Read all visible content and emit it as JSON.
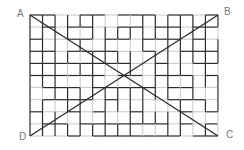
{
  "diagram": {
    "type": "grid-with-diagonals",
    "grid": {
      "columns": 15,
      "rows": 10,
      "origin_x": 30,
      "origin_y": 15,
      "cell_width": 12.53,
      "cell_height": 12.1,
      "dark_color": "#2b2b2b",
      "light_color": "#c8c8c8"
    },
    "corners": [
      {
        "id": "A",
        "label": "A",
        "x": 17,
        "y": 9
      },
      {
        "id": "B",
        "label": "B",
        "x": 224,
        "y": 7
      },
      {
        "id": "C",
        "label": "C",
        "x": 226,
        "y": 130
      },
      {
        "id": "D",
        "label": "D",
        "x": 19,
        "y": 132
      }
    ],
    "diagonals": [
      {
        "from": "A",
        "to": "C",
        "x1": 30,
        "y1": 15,
        "x2": 218,
        "y2": 136
      },
      {
        "from": "D",
        "to": "B",
        "x1": 30,
        "y1": 136,
        "x2": 218,
        "y2": 15
      }
    ],
    "line_color": "#2b2b2b"
  }
}
